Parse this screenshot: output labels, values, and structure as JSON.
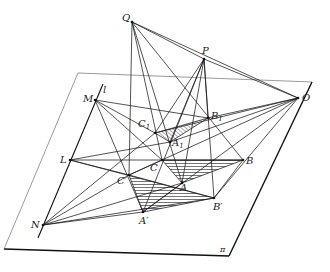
{
  "figure": {
    "type": "projective-geometry-diagram",
    "plane_label": "π",
    "line_label": "l",
    "colors": {
      "stroke": "#1a1a1a",
      "plane_edge": "#333333",
      "hatch": "#1a1a1a",
      "background": "#ffffff"
    },
    "plane": [
      [
        78,
        73
      ],
      [
        312,
        82
      ],
      [
        229,
        256
      ],
      [
        4,
        249
      ]
    ],
    "line_l": [
      [
        103,
        84
      ],
      [
        38,
        238
      ]
    ],
    "points": {
      "Q": {
        "label": "Q",
        "sub": "",
        "x": 132,
        "y": 22,
        "lx": 122,
        "ly": 13
      },
      "P": {
        "label": "P",
        "sub": "",
        "x": 204,
        "y": 59,
        "lx": 202,
        "ly": 46
      },
      "O": {
        "label": "O",
        "sub": "",
        "x": 298,
        "y": 98,
        "lx": 302,
        "ly": 93
      },
      "M": {
        "label": "M",
        "sub": "",
        "x": 95,
        "y": 100,
        "lx": 83,
        "ly": 94
      },
      "L": {
        "label": "L",
        "sub": "",
        "x": 70,
        "y": 160,
        "lx": 60,
        "ly": 155
      },
      "N": {
        "label": "N",
        "sub": "",
        "x": 43,
        "y": 225,
        "lx": 31,
        "ly": 220
      },
      "C1": {
        "label": "C",
        "sub": "1",
        "x": 155,
        "y": 133,
        "lx": 138,
        "ly": 119
      },
      "A1": {
        "label": "A",
        "sub": "1",
        "x": 170,
        "y": 142,
        "lx": 172,
        "ly": 138
      },
      "B1": {
        "label": "B",
        "sub": "1",
        "x": 208,
        "y": 118,
        "lx": 211,
        "ly": 111
      },
      "C": {
        "label": "C",
        "sub": "",
        "x": 162,
        "y": 160,
        "lx": 150,
        "ly": 163
      },
      "A": {
        "label": "A",
        "sub": "",
        "x": 182,
        "y": 183,
        "lx": 180,
        "ly": 183
      },
      "B": {
        "label": "B",
        "sub": "",
        "x": 243,
        "y": 160,
        "lx": 246,
        "ly": 156
      },
      "Cp": {
        "label": "C′",
        "sub": "",
        "x": 129,
        "y": 175,
        "lx": 117,
        "ly": 176
      },
      "Ap": {
        "label": "A′",
        "sub": "",
        "x": 143,
        "y": 212,
        "lx": 139,
        "ly": 216
      },
      "Bp": {
        "label": "B′",
        "sub": "",
        "x": 214,
        "y": 198,
        "lx": 213,
        "ly": 202
      }
    },
    "pi_label_pos": {
      "x": 220,
      "y": 246
    },
    "l_label_pos": {
      "x": 103,
      "y": 85
    },
    "segments": [
      [
        "Q",
        "P"
      ],
      [
        "Q",
        "O"
      ],
      [
        "P",
        "O"
      ],
      [
        "Q",
        "C"
      ],
      [
        "Q",
        "Cp"
      ],
      [
        "Q",
        "A"
      ],
      [
        "Q",
        "B"
      ],
      [
        "P",
        "C1"
      ],
      [
        "P",
        "A1"
      ],
      [
        "P",
        "B1"
      ],
      [
        "P",
        "A"
      ],
      [
        "P",
        "Ap"
      ],
      [
        "P",
        "Bp"
      ],
      [
        "O",
        "C1"
      ],
      [
        "O",
        "A1"
      ],
      [
        "O",
        "B1"
      ],
      [
        "O",
        "Cp"
      ],
      [
        "O",
        "Ap"
      ],
      [
        "O",
        "Bp"
      ],
      [
        "C1",
        "A1"
      ],
      [
        "A1",
        "B1"
      ],
      [
        "C1",
        "B1"
      ],
      [
        "C",
        "A"
      ],
      [
        "A",
        "B"
      ],
      [
        "C",
        "B"
      ],
      [
        "Cp",
        "Ap"
      ],
      [
        "Ap",
        "Bp"
      ],
      [
        "Cp",
        "Bp"
      ],
      [
        "M",
        "C1"
      ],
      [
        "M",
        "B1"
      ],
      [
        "M",
        "C"
      ],
      [
        "M",
        "Ap"
      ],
      [
        "L",
        "A1"
      ],
      [
        "L",
        "B"
      ],
      [
        "L",
        "Cp"
      ],
      [
        "L",
        "Bp"
      ],
      [
        "N",
        "C1"
      ],
      [
        "N",
        "Cp"
      ],
      [
        "N",
        "A"
      ],
      [
        "N",
        "Ap"
      ],
      [
        "N",
        "Bp"
      ],
      [
        "C",
        "Cp"
      ],
      [
        "A",
        "Ap"
      ],
      [
        "B",
        "Bp"
      ]
    ],
    "hatched_triangles": [
      [
        "C1",
        "A1",
        "B1"
      ],
      [
        "C",
        "A",
        "B"
      ],
      [
        "Cp",
        "Ap",
        "Bp"
      ]
    ]
  }
}
